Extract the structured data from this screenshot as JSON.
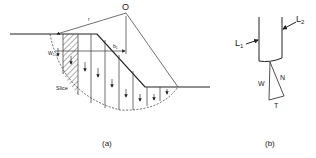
{
  "figure_a": {
    "caption": "(a)",
    "center_label": "O",
    "radius_label": "r",
    "lever_arm_label": "b",
    "lever_arm_subscript": "1",
    "weight_label": "W",
    "weight_subscript": "1",
    "slice_label": "Slice"
  },
  "figure_b": {
    "caption": "(b)",
    "left_force_label": "L",
    "left_force_subscript": "1",
    "right_force_label": "L",
    "right_force_subscript": "2",
    "weight_label": "W",
    "normal_label": "N",
    "tangential_label": "T"
  },
  "colors": {
    "line": "#222222",
    "background": "#ffffff"
  }
}
